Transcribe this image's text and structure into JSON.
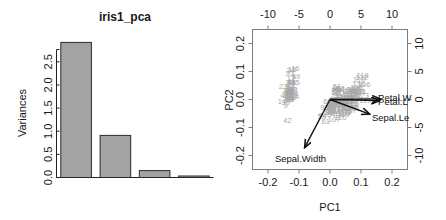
{
  "screeplot": {
    "title": "iris1_pca",
    "ylabel": "Variances",
    "y_ticks": [
      "0.0",
      "0.5",
      "1.0",
      "1.5",
      "2.0",
      "2.5"
    ]
  },
  "biplot": {
    "xlabel": "PC1",
    "ylabel": "PC2",
    "bottom_ticks": [
      "-0.2",
      "-0.1",
      "0.0",
      "0.1",
      "0.2"
    ],
    "left_ticks": [
      "-0.2",
      "-0.1",
      "0.0",
      "0.1",
      "0.2"
    ],
    "top_ticks": [
      "-10",
      "-5",
      "0",
      "5",
      "10"
    ],
    "right_ticks": [
      "-10",
      "-5",
      "0",
      "5",
      "10"
    ],
    "arrow_labels": [
      "Petal.W",
      "Petal.L",
      "Sepal.Le",
      "Sepal.Width"
    ],
    "outlier_labels": [
      "42",
      "61",
      "110",
      "118",
      "132",
      "16",
      "33",
      "34",
      "9",
      "23",
      "24",
      "20",
      "19",
      "15",
      "86",
      "99"
    ]
  },
  "chart_data": [
    {
      "type": "bar",
      "title": "iris1_pca",
      "xlabel": "",
      "ylabel": "Variances",
      "categories": [
        "PC1",
        "PC2",
        "PC3",
        "PC4"
      ],
      "values": [
        2.92,
        0.91,
        0.15,
        0.02
      ],
      "ylim": [
        0,
        2.95
      ],
      "yticks": [
        0.0,
        0.5,
        1.0,
        1.5,
        2.0,
        2.5
      ],
      "grid": false,
      "legend": "none"
    },
    {
      "type": "scatter",
      "title": "",
      "xlabel": "PC1",
      "ylabel": "PC2",
      "xlim": [
        -0.25,
        0.25
      ],
      "ylim": [
        -0.25,
        0.25
      ],
      "xticks": [
        -0.2,
        -0.1,
        0.0,
        0.1,
        0.2
      ],
      "yticks": [
        -0.2,
        -0.1,
        0.0,
        0.1,
        0.2
      ],
      "secondary_xlim": [
        -12.5,
        12.5
      ],
      "secondary_ylim": [
        -12.5,
        12.5
      ],
      "secondary_xticks": [
        -10,
        -5,
        0,
        5,
        10
      ],
      "secondary_yticks": [
        -10,
        -5,
        0,
        5,
        10
      ],
      "grid": false,
      "legend": "none",
      "annotations": [
        {
          "text": "Petal.W",
          "x": 0.155,
          "y": 0.005
        },
        {
          "text": "Petal.L",
          "x": 0.155,
          "y": -0.012
        },
        {
          "text": "Sepal.Le",
          "x": 0.135,
          "y": -0.068
        },
        {
          "text": "Sepal.Width",
          "x": -0.095,
          "y": -0.215
        }
      ],
      "arrows": [
        {
          "name": "Petal.W",
          "x0": 0.0,
          "y0": 0.0,
          "x1": 0.163,
          "y1": 0.002
        },
        {
          "name": "Petal.L",
          "x0": 0.0,
          "y0": 0.0,
          "x1": 0.16,
          "y1": -0.004
        },
        {
          "name": "Sepal.Le",
          "x0": 0.0,
          "y0": 0.0,
          "x1": 0.128,
          "y1": -0.052
        },
        {
          "name": "Sepal.Width",
          "x0": 0.0,
          "y0": 0.0,
          "x1": -0.082,
          "y1": -0.172
        }
      ],
      "series": [
        {
          "name": "setosa",
          "values": [
            [
              -0.132,
              0.035
            ],
            [
              -0.128,
              0.016
            ],
            [
              -0.141,
              0.011
            ],
            [
              -0.139,
              -0.002
            ],
            [
              -0.135,
              0.041
            ],
            [
              -0.116,
              0.079
            ],
            [
              -0.143,
              0.018
            ],
            [
              -0.13,
              0.024
            ],
            [
              -0.143,
              -0.024
            ],
            [
              -0.13,
              0.005
            ],
            [
              -0.124,
              0.064
            ],
            [
              -0.131,
              0.017
            ],
            [
              -0.134,
              -0.003
            ],
            [
              -0.155,
              -0.008
            ],
            [
              -0.122,
              0.106
            ],
            [
              -0.112,
              0.11
            ],
            [
              -0.126,
              0.074
            ],
            [
              -0.13,
              0.034
            ],
            [
              -0.11,
              0.08
            ],
            [
              -0.126,
              0.055
            ],
            [
              -0.115,
              0.031
            ],
            [
              -0.124,
              0.048
            ],
            [
              -0.152,
              0.044
            ],
            [
              -0.113,
              0.01
            ],
            [
              -0.121,
              0.012
            ],
            [
              -0.121,
              0.006
            ],
            [
              -0.124,
              0.026
            ],
            [
              -0.128,
              0.036
            ],
            [
              -0.129,
              0.031
            ],
            [
              -0.133,
              0.004
            ],
            [
              -0.128,
              -0.001
            ],
            [
              -0.119,
              0.035
            ],
            [
              -0.131,
              0.091
            ],
            [
              -0.127,
              0.1
            ],
            [
              -0.128,
              0.003
            ],
            [
              -0.135,
              0.016
            ],
            [
              -0.13,
              0.06
            ],
            [
              -0.14,
              0.031
            ],
            [
              -0.143,
              -0.011
            ],
            [
              -0.128,
              0.024
            ],
            [
              -0.135,
              0.03
            ],
            [
              -0.137,
              -0.077
            ],
            [
              -0.146,
              0.011
            ],
            [
              -0.117,
              0.02
            ],
            [
              -0.111,
              0.059
            ],
            [
              -0.131,
              0.004
            ],
            [
              -0.126,
              0.06
            ],
            [
              -0.14,
              0.009
            ],
            [
              -0.124,
              0.06
            ],
            [
              -0.131,
              0.024
            ]
          ]
        },
        {
          "name": "versicolor",
          "values": [
            [
              0.022,
              0.045
            ],
            [
              0.018,
              0.022
            ],
            [
              0.034,
              0.038
            ],
            [
              0.004,
              -0.056
            ],
            [
              0.029,
              0.008
            ],
            [
              0.01,
              -0.023
            ],
            [
              0.025,
              0.03
            ],
            [
              -0.026,
              -0.062
            ],
            [
              0.023,
              0.029
            ],
            [
              -0.001,
              -0.041
            ],
            [
              -0.014,
              -0.079
            ],
            [
              0.011,
              -0.003
            ],
            [
              0.009,
              -0.045
            ],
            [
              0.025,
              -0.006
            ],
            [
              -0.008,
              -0.008
            ],
            [
              0.018,
              0.035
            ],
            [
              0.011,
              -0.02
            ],
            [
              0.006,
              -0.029
            ],
            [
              0.032,
              -0.053
            ],
            [
              0.002,
              -0.041
            ],
            [
              0.029,
              0.01
            ],
            [
              0.013,
              -0.005
            ],
            [
              0.037,
              -0.027
            ],
            [
              0.026,
              -0.011
            ],
            [
              0.016,
              0.012
            ],
            [
              0.021,
              0.03
            ],
            [
              0.035,
              0.02
            ],
            [
              0.04,
              0.027
            ],
            [
              0.021,
              -0.002
            ],
            [
              -0.005,
              -0.032
            ],
            [
              -0.002,
              -0.048
            ],
            [
              -0.003,
              -0.048
            ],
            [
              0.005,
              -0.022
            ],
            [
              0.035,
              -0.03
            ],
            [
              0.01,
              -0.005
            ],
            [
              0.022,
              0.039
            ],
            [
              0.033,
              0.033
            ],
            [
              0.02,
              -0.044
            ],
            [
              0.009,
              -0.014
            ],
            [
              0.006,
              -0.042
            ],
            [
              0.008,
              -0.038
            ],
            [
              0.026,
              -0.003
            ],
            [
              0.005,
              -0.027
            ],
            [
              -0.024,
              -0.06
            ],
            [
              0.009,
              -0.021
            ],
            [
              0.01,
              -0.005
            ],
            [
              0.01,
              -0.01
            ],
            [
              0.019,
              -0.008
            ],
            [
              -0.018,
              -0.029
            ],
            [
              0.008,
              -0.018
            ]
          ]
        },
        {
          "name": "virginica",
          "values": [
            [
              0.077,
              -0.034
            ],
            [
              0.044,
              -0.035
            ],
            [
              0.073,
              0.005
            ],
            [
              0.055,
              -0.011
            ],
            [
              0.073,
              -0.016
            ],
            [
              0.11,
              0.051
            ],
            [
              0.013,
              -0.074
            ],
            [
              0.095,
              0.028
            ],
            [
              0.069,
              -0.03
            ],
            [
              0.094,
              0.068
            ],
            [
              0.057,
              0.017
            ],
            [
              0.054,
              -0.008
            ],
            [
              0.067,
              0.011
            ],
            [
              0.044,
              -0.054
            ],
            [
              0.051,
              -0.045
            ],
            [
              0.066,
              0.029
            ],
            [
              0.058,
              0.004
            ],
            [
              0.105,
              0.085
            ],
            [
              0.113,
              -0.004
            ],
            [
              0.034,
              -0.066
            ],
            [
              0.075,
              0.032
            ],
            [
              0.042,
              -0.036
            ],
            [
              0.105,
              0.012
            ],
            [
              0.038,
              -0.014
            ],
            [
              0.071,
              0.027
            ],
            [
              0.085,
              0.04
            ],
            [
              0.034,
              -0.008
            ],
            [
              0.032,
              -0.002
            ],
            [
              0.067,
              -0.018
            ],
            [
              0.077,
              0.026
            ],
            [
              0.094,
              0.028
            ],
            [
              0.102,
              0.078
            ],
            [
              0.069,
              -0.02
            ],
            [
              0.039,
              -0.018
            ],
            [
              0.048,
              -0.049
            ],
            [
              0.092,
              0.05
            ],
            [
              0.065,
              -0.04
            ],
            [
              0.05,
              0.004
            ],
            [
              0.029,
              -0.007
            ],
            [
              0.08,
              0.025
            ],
            [
              0.081,
              0.012
            ],
            [
              0.063,
              0.013
            ],
            [
              0.044,
              -0.035
            ],
            [
              0.083,
              0.018
            ],
            [
              0.083,
              0.032
            ],
            [
              0.07,
              0.016
            ],
            [
              0.034,
              -0.024
            ],
            [
              0.059,
              0.003
            ],
            [
              0.073,
              0.032
            ],
            [
              0.051,
              -0.02
            ]
          ]
        }
      ]
    }
  ]
}
